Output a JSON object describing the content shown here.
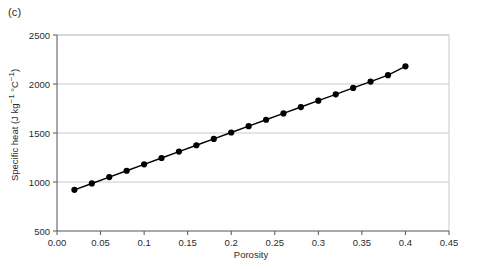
{
  "figure": {
    "panel_label": "(c)"
  },
  "chart_data": {
    "type": "scatter",
    "title": "",
    "subtitle": "",
    "xlabel": "Porosity",
    "ylabel": "Specific heat (J kg−1 °C−1)",
    "ylabel_parts": {
      "base": "Specific heat (J kg",
      "sup1": "−1",
      "mid": " °C",
      "sup2": "−1",
      "close": ")"
    },
    "xlim": [
      0.0,
      0.45
    ],
    "ylim": [
      500,
      2500
    ],
    "xticks": [
      0.0,
      0.05,
      0.1,
      0.15,
      0.2,
      0.25,
      0.3,
      0.35,
      0.4,
      0.45
    ],
    "xtick_labels": [
      "0.00",
      "0.05",
      "0.1",
      "0.15",
      "0.2",
      "0.25",
      "0.3",
      "0.35",
      "0.4",
      "0.45"
    ],
    "yticks": [
      500,
      1000,
      1500,
      2000,
      2500
    ],
    "ytick_labels": [
      "500",
      "1000",
      "1500",
      "2000",
      "2500"
    ],
    "grid": "horizontal",
    "legend": "none",
    "marker": "filled-circle",
    "line_style": "solid",
    "series": [
      {
        "name": "Specific heat vs porosity",
        "x": [
          0.02,
          0.04,
          0.06,
          0.08,
          0.1,
          0.12,
          0.14,
          0.16,
          0.18,
          0.2,
          0.22,
          0.24,
          0.26,
          0.28,
          0.3,
          0.32,
          0.34,
          0.36,
          0.38,
          0.4
        ],
        "y": [
          920,
          985,
          1050,
          1115,
          1180,
          1245,
          1310,
          1375,
          1440,
          1505,
          1570,
          1635,
          1700,
          1765,
          1830,
          1895,
          1960,
          2025,
          2090,
          2180
        ]
      }
    ]
  },
  "colors": {
    "marker": "#000000",
    "line": "#000000",
    "grid": "#c9c9c9",
    "axis": "#555555",
    "text": "#2b2b2b",
    "background": "#ffffff"
  }
}
